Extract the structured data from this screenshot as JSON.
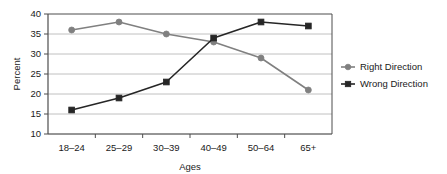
{
  "chart_data": {
    "type": "line",
    "title": "",
    "xlabel": "Ages",
    "ylabel": "Percent",
    "categories": [
      "18–24",
      "25–29",
      "30–39",
      "40–49",
      "50–64",
      "65+"
    ],
    "series": [
      {
        "name": "Right Direction",
        "values": [
          36,
          38,
          35,
          33,
          29,
          21
        ],
        "color": "#808080",
        "marker": "circle"
      },
      {
        "name": "Wrong Direction",
        "values": [
          16,
          19,
          23,
          34,
          38,
          37
        ],
        "color": "#262626",
        "marker": "square"
      }
    ],
    "ylim": [
      10,
      40
    ],
    "yticks": [
      10,
      15,
      20,
      25,
      30,
      35,
      40
    ],
    "ytick_labels": [
      "10",
      "15",
      "20",
      "25",
      "30",
      "35",
      "40"
    ],
    "grid": true,
    "grid_axis": "y",
    "grid_color": "#b0b0b0",
    "legend_position": "right",
    "axis_color": "#4d4d4d",
    "background": "#ffffff"
  }
}
